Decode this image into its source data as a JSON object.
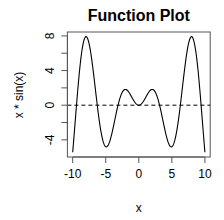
{
  "chart_data": {
    "type": "line",
    "title": "Function Plot",
    "xlabel": "x",
    "ylabel": "x * sin(x)",
    "function": "x * sin(x)",
    "x_range": [
      -10,
      10
    ],
    "xlim": [
      -10.8,
      10.8
    ],
    "ylim": [
      -5.98,
      8.45
    ],
    "x_ticks": [
      -10,
      -5,
      0,
      5,
      10
    ],
    "y_ticks": [
      -4,
      -2,
      0,
      2,
      4,
      6,
      8
    ],
    "y_tick_labels": [
      "-4",
      "",
      "0",
      "",
      "4",
      "",
      "8"
    ],
    "x_tick_labels": [
      "-10",
      "-5",
      "0",
      "5",
      "10"
    ],
    "grid": false,
    "legend": null,
    "series": [
      {
        "name": "x * sin(x)",
        "style": "solid",
        "color": "#000000",
        "x": [
          -10,
          -9,
          -8,
          -7.98,
          -7,
          -6,
          -5,
          -4.91,
          -4,
          -3,
          -2.03,
          -1,
          0,
          1,
          2.03,
          3,
          4,
          4.91,
          5,
          6,
          7,
          7.98,
          8,
          9,
          10
        ],
        "values": [
          -5.44,
          -3.71,
          7.91,
          7.92,
          4.6,
          -1.68,
          -4.79,
          -4.81,
          -3.03,
          0.42,
          1.82,
          0.84,
          0,
          0.84,
          1.82,
          0.42,
          -3.03,
          -4.81,
          -4.79,
          -1.68,
          4.6,
          7.92,
          7.91,
          -3.71,
          -5.44
        ]
      },
      {
        "name": "y = 0 reference",
        "style": "dashed",
        "color": "#000000",
        "x": [
          -10.8,
          10.8
        ],
        "values": [
          0,
          0
        ]
      }
    ],
    "annotations": []
  },
  "layout": {
    "plot_box": {
      "left": 67.4,
      "top": 32,
      "right": 210.2,
      "bottom": 157
    },
    "line_color": "#000000",
    "box_color": "#555555"
  }
}
